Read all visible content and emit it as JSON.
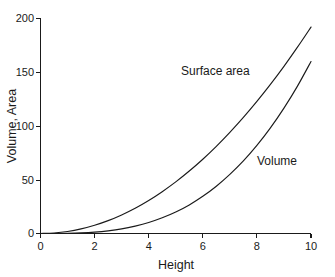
{
  "chart_data": {
    "type": "line",
    "title": "",
    "subtitle": "",
    "xlabel": "Height",
    "ylabel": "Volume, Area",
    "xlim": [
      0,
      10
    ],
    "ylim": [
      0,
      200
    ],
    "xticks": [
      "0",
      "2",
      "4",
      "6",
      "8",
      "10"
    ],
    "xtick_values": [
      0,
      2,
      4,
      6,
      8,
      10
    ],
    "yticks": [
      "0",
      "50",
      "100",
      "150",
      "200"
    ],
    "ytick_values": [
      0,
      50,
      100,
      150,
      200
    ],
    "grid": false,
    "legend_position": "inline-annotation",
    "x": [
      0,
      0.5,
      1,
      1.5,
      2,
      2.5,
      3,
      3.5,
      4,
      4.5,
      5,
      5.5,
      6,
      6.5,
      7,
      7.5,
      8,
      8.5,
      9,
      9.5,
      10
    ],
    "series": [
      {
        "name": "Surface area",
        "label_text": "Surface area",
        "values": [
          0,
          0.5,
          1.9,
          4.3,
          7.7,
          12.0,
          17.3,
          23.5,
          30.7,
          38.9,
          48.0,
          58.1,
          69.1,
          81.1,
          94.1,
          108.0,
          122.9,
          138.7,
          155.5,
          173.3,
          192.0
        ],
        "color": "#1a1a1a",
        "value_at_x10": 192
      },
      {
        "name": "Volume",
        "label_text": "Volume",
        "values": [
          0,
          0.02,
          0.16,
          0.54,
          1.28,
          2.5,
          4.3,
          6.9,
          10.2,
          14.6,
          20.0,
          26.6,
          34.6,
          44.0,
          55.0,
          67.5,
          81.9,
          98.2,
          116.6,
          137.1,
          160.0
        ],
        "color": "#1a1a1a",
        "value_at_x10": 160
      }
    ],
    "annotations": [
      {
        "text": "Surface area",
        "x_px": 181,
        "y_px": 75
      },
      {
        "text": "Volume",
        "x_px": 257,
        "y_px": 165
      }
    ]
  },
  "axes": {
    "x_title": "Height",
    "y_title": "Volume, Area"
  }
}
